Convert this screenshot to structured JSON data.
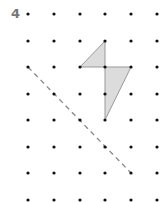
{
  "question": {
    "number": "4"
  },
  "grid": {
    "columns": [
      28,
      54,
      80,
      105,
      131,
      157
    ],
    "rows": [
      14,
      41,
      67,
      94,
      120,
      147,
      173,
      200
    ],
    "dot_color": "#111111"
  },
  "kite": {
    "points": "105,41 80,67 131,67 105,120",
    "fill": "#dcdcdc",
    "stroke": "#999999"
  },
  "mirror_line": {
    "x1": 28,
    "y1": 67,
    "x2": 131,
    "y2": 173,
    "color": "#888888",
    "style": "dashed"
  }
}
